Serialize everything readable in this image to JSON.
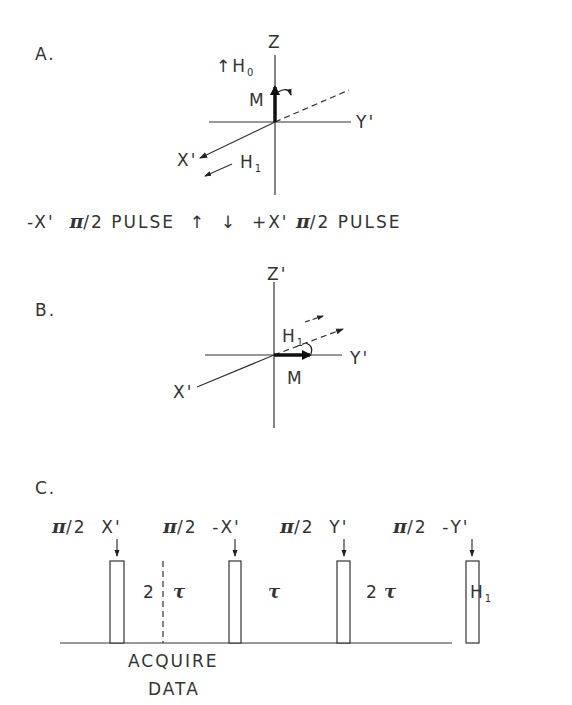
{
  "panel_a": {
    "label": "A.",
    "axes": {
      "z": "Z",
      "y": "Y'",
      "x": "X'"
    },
    "field_label": "↑H",
    "field_sub": "0",
    "magnetization": "M",
    "rf_label": "H",
    "rf_sub": "1"
  },
  "pulse_caption": {
    "left_axis": "-X'",
    "left_pi": "π",
    "left_rest": "/2 PULSE",
    "arrows": "↑  ↓",
    "right_axis": "+X'",
    "right_pi": "π",
    "right_rest": "/2 PULSE"
  },
  "panel_b": {
    "label": "B.",
    "axes": {
      "z": "Z'",
      "y": "Y'",
      "x": "X'"
    },
    "magnetization": "M",
    "rf_label": "H",
    "rf_sub": "1"
  },
  "panel_c": {
    "label": "C.",
    "pulses": [
      {
        "pi": "π",
        "text": "/2  X'"
      },
      {
        "pi": "π",
        "text": "/2  -X'"
      },
      {
        "pi": "π",
        "text": "/2  Y'"
      },
      {
        "pi": "π",
        "text": "/2  -Y'"
      }
    ],
    "intervals": [
      {
        "num": "2",
        "tau": "τ"
      },
      {
        "num": "",
        "tau": "τ"
      },
      {
        "num": "2",
        "tau": "τ"
      }
    ],
    "channel_label": "H",
    "channel_sub": "1",
    "acquire_line1": "ACQUIRE",
    "acquire_line2": "DATA"
  }
}
